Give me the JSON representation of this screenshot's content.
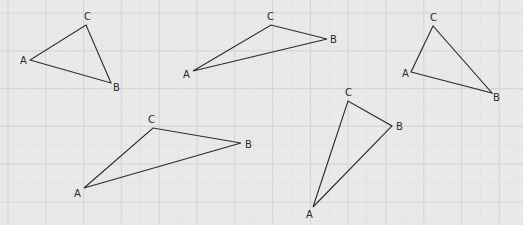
{
  "background": "#e9e9e9",
  "grid": {
    "major_color": "#d6d6d6",
    "minor_color": "#e2e2e2",
    "spacing": 37.8,
    "offset_x": 8,
    "offset_y": 13
  },
  "stroke_color": "#2a2a2a",
  "triangles": [
    {
      "A": [
        30,
        60
      ],
      "B": [
        111,
        83
      ],
      "C": [
        86,
        25
      ],
      "labels": {
        "A": [
          20,
          64
        ],
        "B": [
          113,
          91
        ],
        "C": [
          84,
          20
        ]
      }
    },
    {
      "A": [
        193,
        71
      ],
      "B": [
        327,
        39
      ],
      "C": [
        271,
        25
      ],
      "labels": {
        "A": [
          183,
          78
        ],
        "B": [
          330,
          43
        ],
        "C": [
          267,
          20
        ]
      }
    },
    {
      "A": [
        411,
        72
      ],
      "B": [
        492,
        93
      ],
      "C": [
        433,
        26
      ],
      "labels": {
        "A": [
          402,
          77
        ],
        "B": [
          493,
          101
        ],
        "C": [
          430,
          21
        ]
      }
    },
    {
      "A": [
        84,
        188
      ],
      "B": [
        241,
        143
      ],
      "C": [
        153,
        128
      ],
      "labels": {
        "A": [
          74,
          197
        ],
        "B": [
          245,
          148
        ],
        "C": [
          148,
          123
        ]
      }
    },
    {
      "A": [
        313,
        207
      ],
      "B": [
        392,
        126
      ],
      "C": [
        348,
        101
      ],
      "labels": {
        "A": [
          306,
          218
        ],
        "B": [
          396,
          130
        ],
        "C": [
          345,
          96
        ]
      }
    }
  ],
  "vertex_names": {
    "A": "A",
    "B": "B",
    "C": "C"
  }
}
